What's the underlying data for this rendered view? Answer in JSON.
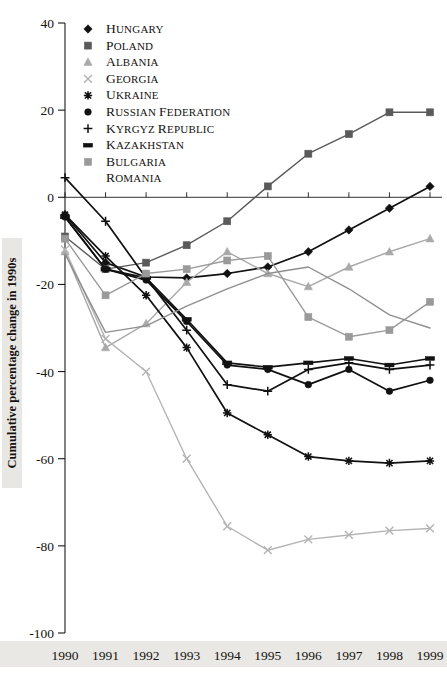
{
  "chart_data": {
    "type": "line",
    "title": "",
    "xlabel": "",
    "ylabel": "Cumulative percentage change in 1990s",
    "x": [
      1990,
      1991,
      1992,
      1993,
      1994,
      1995,
      1996,
      1997,
      1998,
      1999
    ],
    "xtick_labels": [
      "1990",
      "1991",
      "1992",
      "1993",
      "1994",
      "1995",
      "1996",
      "1997",
      "1998",
      "1999"
    ],
    "ylim": [
      -100,
      40
    ],
    "ytick_labels": [
      "40",
      "20",
      "0",
      "-20",
      "-40",
      "-60",
      "-80",
      "-100"
    ],
    "yticks": [
      40,
      20,
      0,
      -20,
      -40,
      -60,
      -80,
      -100
    ],
    "grid": false,
    "zero_line": true,
    "legend_position": "top-left",
    "series": [
      {
        "name": "Hungary",
        "marker": "diamond",
        "color": "#111111",
        "values": [
          -4.0,
          -15.0,
          -18.3,
          -18.5,
          -17.5,
          -16.0,
          -12.5,
          -7.5,
          -2.5,
          2.5
        ]
      },
      {
        "name": "Poland",
        "marker": "square",
        "color": "#5a5a5a",
        "values": [
          -9.0,
          -16.5,
          -15.0,
          -11.0,
          -5.5,
          2.5,
          10.0,
          14.5,
          19.5,
          19.5
        ]
      },
      {
        "name": "Albania",
        "marker": "triangle",
        "color": "#a9a9a9",
        "values": [
          -12.5,
          -34.5,
          -29.0,
          -19.5,
          -12.5,
          -17.5,
          -20.5,
          -16.0,
          -12.5,
          -9.5
        ]
      },
      {
        "name": "Georgia",
        "marker": "x",
        "color": "#b4b4b4",
        "values": [
          -12.0,
          -32.5,
          -40.0,
          -60.0,
          -75.5,
          -81.0,
          -78.5,
          -77.5,
          -76.5,
          -76.0
        ]
      },
      {
        "name": "Ukraine",
        "marker": "asterisk",
        "color": "#111111",
        "values": [
          -4.0,
          -13.5,
          -22.5,
          -34.5,
          -49.5,
          -54.5,
          -59.5,
          -60.5,
          -61.0,
          -60.5
        ]
      },
      {
        "name": "Russian Federation",
        "marker": "circle",
        "color": "#111111",
        "values": [
          -4.5,
          -16.5,
          -19.0,
          -28.5,
          -38.5,
          -39.5,
          -43.0,
          -39.5,
          -44.5,
          -42.0
        ]
      },
      {
        "name": "Kyrgyz Republic",
        "marker": "plus",
        "color": "#111111",
        "values": [
          4.5,
          -5.5,
          -18.5,
          -30.5,
          -43.0,
          -44.5,
          -39.5,
          -38.0,
          -39.5,
          -38.5
        ]
      },
      {
        "name": "Kazakhstan",
        "marker": "dash",
        "color": "#111111",
        "values": [
          -4.5,
          -16.5,
          -18.5,
          -28.0,
          -38.0,
          -39.0,
          -38.0,
          -37.0,
          -38.5,
          -37.0
        ]
      },
      {
        "name": "Bulgaria",
        "marker": "square-gray",
        "color": "#9a9a9a",
        "values": [
          -9.5,
          -22.5,
          -17.5,
          -16.5,
          -14.5,
          -13.5,
          -27.5,
          -32.0,
          -30.5,
          -24.0
        ]
      },
      {
        "name": "Romania",
        "marker": "none",
        "color": "#8f8f8f",
        "values": [
          -13.0,
          -31.0,
          -29.5,
          -25.0,
          -21.0,
          -17.5,
          -16.0,
          -21.0,
          -27.0,
          -30.0
        ]
      }
    ]
  },
  "legend": {
    "items": [
      {
        "label": "Hungary",
        "marker": "diamond",
        "color": "#111111"
      },
      {
        "label": "Poland",
        "marker": "square",
        "color": "#5a5a5a"
      },
      {
        "label": "Albania",
        "marker": "triangle",
        "color": "#a9a9a9"
      },
      {
        "label": "Georgia",
        "marker": "x",
        "color": "#b4b4b4"
      },
      {
        "label": "Ukraine",
        "marker": "asterisk",
        "color": "#111111"
      },
      {
        "label": "Russian Federation",
        "marker": "circle",
        "color": "#111111"
      },
      {
        "label": "Kyrgyz Republic",
        "marker": "plus",
        "color": "#111111"
      },
      {
        "label": "Kazakhstan",
        "marker": "dash",
        "color": "#111111"
      },
      {
        "label": "Bulgaria",
        "marker": "square-gray",
        "color": "#9a9a9a"
      },
      {
        "label": "Romania",
        "marker": "none",
        "color": "#8f8f8f"
      }
    ]
  }
}
